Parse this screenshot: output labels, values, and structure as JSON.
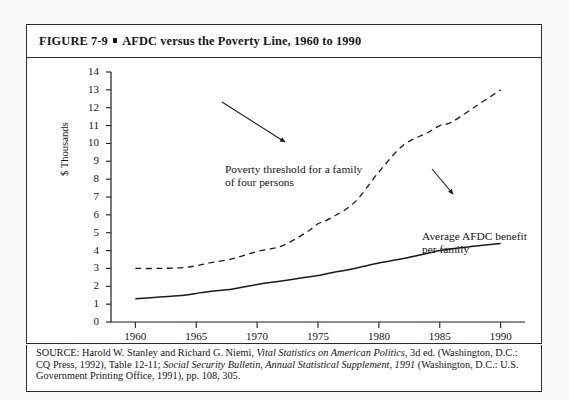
{
  "figure": {
    "label": "FIGURE 7-9",
    "separator": "square-bullet",
    "title": "AFDC versus the Poverty Line, 1960 to 1990"
  },
  "source": {
    "line1_prefix": "SOURCE: Harold W. Stanley and Richard G. Niemi, ",
    "line1_italic": "Vital Statistics on American Politics,",
    "line1_suffix": " 3d ed.",
    "line2_prefix": "(Washington, D.C.: CQ Press, 1992), Table 12-11; ",
    "line2_italic": "Social Security Bulletin, Annual Statistical",
    "line3_italic": "Supplement, 1991",
    "line3_suffix": " (Washington, D.C.: U.S. Government Printing Office, 1991), pp. 108, 305."
  },
  "annotations": {
    "poverty_line1": "Poverty threshold for a family",
    "poverty_line2": "of four persons",
    "afdc_line1": "Average AFDC benefit",
    "afdc_line2": "per family"
  },
  "chart_data": {
    "type": "line",
    "title": "AFDC versus the Poverty Line, 1960 to 1990",
    "xlabel": "",
    "ylabel": "$ Thousands",
    "xlim": [
      1958,
      1992
    ],
    "ylim": [
      0,
      14
    ],
    "xticks": [
      1960,
      1965,
      1970,
      1975,
      1980,
      1985,
      1990
    ],
    "yticks": [
      0,
      1,
      2,
      3,
      4,
      5,
      6,
      7,
      8,
      9,
      10,
      11,
      12,
      13,
      14
    ],
    "grid": false,
    "legend": "annotations-inline",
    "x": [
      1960,
      1962,
      1964,
      1965,
      1966,
      1968,
      1970,
      1972,
      1974,
      1975,
      1976,
      1978,
      1980,
      1982,
      1984,
      1985,
      1986,
      1988,
      1990
    ],
    "series": [
      {
        "name": "Poverty threshold for a family of four persons",
        "style": "dashed",
        "values": [
          3.0,
          3.0,
          3.05,
          3.15,
          3.3,
          3.55,
          3.95,
          4.25,
          5.0,
          5.5,
          5.8,
          6.7,
          8.4,
          9.9,
          10.6,
          11.0,
          11.2,
          12.1,
          13.0
        ]
      },
      {
        "name": "Average AFDC benefit per family",
        "style": "solid",
        "values": [
          1.3,
          1.4,
          1.5,
          1.6,
          1.7,
          1.85,
          2.1,
          2.3,
          2.5,
          2.6,
          2.75,
          3.0,
          3.3,
          3.55,
          3.85,
          4.0,
          4.1,
          4.25,
          4.4
        ]
      }
    ]
  }
}
